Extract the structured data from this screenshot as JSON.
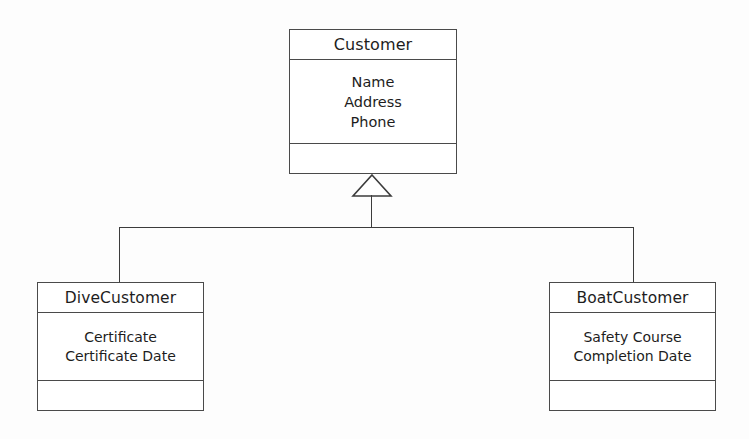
{
  "diagram": {
    "type": "uml-class-diagram",
    "relationship": "generalization",
    "background_color": "#fdfdfd",
    "line_color": "#3c3c3c",
    "text_color": "#1d1d1d"
  },
  "classes": {
    "superclass": {
      "name": "Customer",
      "attributes": [
        "Name",
        "Address",
        "Phone"
      ],
      "operations": []
    },
    "subclass_left": {
      "name": "DiveCustomer",
      "attributes": [
        "Certificate",
        "Certificate Date"
      ],
      "operations": []
    },
    "subclass_right": {
      "name": "BoatCustomer",
      "attributes": [
        "Safety Course",
        "Completion Date"
      ],
      "operations": []
    }
  },
  "connectors": {
    "generalization_arrow": "hollow-triangle-icon",
    "target": "Customer",
    "sources": [
      "DiveCustomer",
      "BoatCustomer"
    ]
  }
}
